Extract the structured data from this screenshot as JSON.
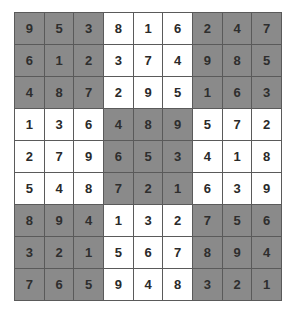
{
  "puzzle": {
    "type": "sudoku",
    "size": 9,
    "shaded_boxes": [
      "top-left",
      "top-right",
      "center",
      "bottom-left",
      "bottom-right"
    ],
    "colors": {
      "shaded_cell": "#8a8a8a",
      "plain_cell": "#ffffff",
      "grid_line": "#5a5a5a",
      "digit": "#2a2a2a"
    },
    "rows": [
      [
        "9",
        "5",
        "3",
        "8",
        "1",
        "6",
        "2",
        "4",
        "7"
      ],
      [
        "6",
        "1",
        "2",
        "3",
        "7",
        "4",
        "9",
        "8",
        "5"
      ],
      [
        "4",
        "8",
        "7",
        "2",
        "9",
        "5",
        "1",
        "6",
        "3"
      ],
      [
        "1",
        "3",
        "6",
        "4",
        "8",
        "9",
        "5",
        "7",
        "2"
      ],
      [
        "2",
        "7",
        "9",
        "6",
        "5",
        "3",
        "4",
        "1",
        "8"
      ],
      [
        "5",
        "4",
        "8",
        "7",
        "2",
        "1",
        "6",
        "3",
        "9"
      ],
      [
        "8",
        "9",
        "4",
        "1",
        "3",
        "2",
        "7",
        "5",
        "6"
      ],
      [
        "3",
        "2",
        "1",
        "5",
        "6",
        "7",
        "8",
        "9",
        "4"
      ],
      [
        "7",
        "6",
        "5",
        "9",
        "4",
        "8",
        "3",
        "2",
        "1"
      ]
    ]
  }
}
